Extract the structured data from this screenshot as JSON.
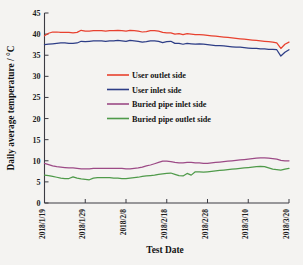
{
  "chart_data": {
    "type": "line",
    "title": "",
    "xlabel": "Test Date",
    "ylabel": "Daily average temperature / °C",
    "ylim": [
      0,
      45
    ],
    "yticks": [
      0,
      5,
      10,
      15,
      20,
      25,
      30,
      35,
      40,
      45
    ],
    "grid": false,
    "legend_position": "center",
    "x_tick_labels": [
      "2018/1/19",
      "2018/1/29",
      "2018/2/8",
      "2018/2/18",
      "2018/2/28",
      "2018/3/10",
      "2018/3/20"
    ],
    "x_tick_indices": [
      0,
      10,
      20,
      30,
      40,
      50,
      60
    ],
    "x_index_range": [
      0,
      60
    ],
    "series": [
      {
        "name": "User outlet side",
        "color": "#e8412f",
        "values": [
          39.6,
          40.2,
          40.5,
          40.5,
          40.4,
          40.4,
          40.4,
          40.3,
          40.4,
          40.9,
          40.7,
          40.7,
          40.8,
          40.8,
          40.8,
          40.7,
          40.8,
          40.8,
          40.9,
          40.8,
          40.7,
          40.9,
          40.8,
          40.7,
          40.5,
          40.6,
          40.8,
          40.8,
          40.7,
          40.4,
          40.3,
          40.3,
          40.0,
          40.1,
          39.9,
          40.1,
          40.0,
          39.9,
          39.9,
          39.8,
          39.7,
          39.6,
          39.5,
          39.4,
          39.3,
          39.2,
          39.1,
          39.0,
          38.9,
          38.8,
          38.7,
          38.6,
          38.5,
          38.4,
          38.3,
          38.2,
          38.1,
          37.9,
          36.6,
          37.6,
          38.1
        ]
      },
      {
        "name": "User inlet side",
        "color": "#2d3d86",
        "values": [
          37.5,
          37.6,
          37.7,
          37.8,
          37.9,
          37.9,
          37.8,
          37.8,
          37.9,
          38.3,
          38.2,
          38.3,
          38.4,
          38.4,
          38.4,
          38.3,
          38.4,
          38.4,
          38.5,
          38.4,
          38.3,
          38.5,
          38.4,
          38.3,
          38.1,
          38.2,
          38.4,
          38.4,
          38.3,
          38.0,
          38.2,
          38.3,
          37.8,
          37.8,
          37.6,
          37.8,
          37.7,
          37.6,
          37.7,
          37.6,
          37.5,
          37.4,
          37.3,
          37.3,
          37.2,
          37.1,
          37.0,
          36.9,
          36.9,
          36.8,
          36.7,
          36.6,
          36.6,
          36.5,
          36.5,
          36.4,
          36.4,
          36.3,
          34.8,
          35.7,
          36.3
        ]
      },
      {
        "name": "Buried pipe inlet side",
        "color": "#9c4a86",
        "values": [
          9.4,
          9.1,
          8.8,
          8.6,
          8.5,
          8.4,
          8.3,
          8.3,
          8.2,
          8.1,
          8.1,
          8.1,
          8.2,
          8.2,
          8.2,
          8.2,
          8.2,
          8.2,
          8.2,
          8.2,
          8.1,
          8.1,
          8.2,
          8.3,
          8.5,
          8.8,
          9.0,
          9.3,
          9.6,
          9.9,
          9.9,
          9.8,
          9.6,
          9.5,
          9.5,
          9.6,
          9.6,
          9.5,
          9.5,
          9.4,
          9.4,
          9.5,
          9.6,
          9.7,
          9.8,
          9.9,
          10.0,
          10.1,
          10.2,
          10.3,
          10.4,
          10.5,
          10.6,
          10.7,
          10.7,
          10.6,
          10.5,
          10.4,
          10.1,
          10.0,
          10.0
        ]
      },
      {
        "name": "Buried pipe outlet side",
        "color": "#4f9a4a",
        "values": [
          6.6,
          6.5,
          6.3,
          6.1,
          5.9,
          5.8,
          5.8,
          6.2,
          5.9,
          5.7,
          5.6,
          5.5,
          5.9,
          6.0,
          6.0,
          6.0,
          6.0,
          5.9,
          5.9,
          5.8,
          5.8,
          5.9,
          6.0,
          6.1,
          6.3,
          6.4,
          6.5,
          6.6,
          6.8,
          6.9,
          7.0,
          7.1,
          6.8,
          6.5,
          6.4,
          7.0,
          6.6,
          7.4,
          7.4,
          7.3,
          7.4,
          7.5,
          7.6,
          7.7,
          7.8,
          7.9,
          8.0,
          8.1,
          8.2,
          8.3,
          8.4,
          8.5,
          8.6,
          8.7,
          8.6,
          8.3,
          8.0,
          7.9,
          7.8,
          8.0,
          8.2
        ]
      }
    ]
  },
  "legend": {
    "items": [
      {
        "label": "User outlet side",
        "color": "#e8412f"
      },
      {
        "label": "User inlet side",
        "color": "#2d3d86"
      },
      {
        "label": "Buried pipe inlet side",
        "color": "#9c4a86"
      },
      {
        "label": "Buried pipe outlet side",
        "color": "#4f9a4a"
      }
    ]
  }
}
